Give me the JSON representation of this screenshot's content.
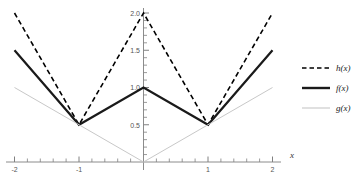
{
  "chart_data": {
    "type": "line",
    "title": "",
    "subtitle": "",
    "xlabel": "x",
    "ylabel": "",
    "xlim": [
      -2.1,
      2.12
    ],
    "ylim": [
      -0.12,
      2.08
    ],
    "grid": false,
    "legend_position": "right",
    "x_ticks": [
      -2,
      -1,
      1,
      2
    ],
    "x_tick_labels": [
      "-2",
      "-1",
      "1",
      "2"
    ],
    "y_ticks": [
      0.5,
      1.0,
      1.5,
      2.0
    ],
    "y_tick_labels": [
      "0.5",
      "1.0",
      "1.5",
      "2.0"
    ],
    "x_minor_ticks": [
      -1.8,
      -1.6,
      -1.4,
      -1.2,
      -0.8,
      -0.6,
      -0.4,
      -0.2,
      0.2,
      0.4,
      0.6,
      0.8,
      1.2,
      1.4,
      1.6,
      1.8
    ],
    "y_minor_ticks": [
      0.1,
      0.2,
      0.3,
      0.4,
      0.6,
      0.7,
      0.8,
      0.9,
      1.1,
      1.2,
      1.3,
      1.4,
      1.6,
      1.7,
      1.8,
      1.9
    ],
    "series": [
      {
        "name": "h(x)",
        "style": "dashed",
        "color": "#000000",
        "width": 1.6,
        "x": [
          -2,
          -1,
          0,
          1,
          2
        ],
        "values": [
          2.0,
          0.5,
          2.0,
          0.5,
          2.0
        ]
      },
      {
        "name": "f(x)",
        "style": "solid",
        "color": "#1a1a1a",
        "width": 2.2,
        "x": [
          -2,
          -1,
          0,
          1,
          2
        ],
        "values": [
          1.5,
          0.5,
          1.0,
          0.5,
          1.5
        ]
      },
      {
        "name": "g(x)",
        "style": "solid",
        "color": "#c8c8c8",
        "width": 1.0,
        "x": [
          -2,
          0,
          2
        ],
        "values": [
          1.0,
          0.0,
          1.0
        ]
      }
    ],
    "legend": [
      {
        "label": "h(x)",
        "style": "dashed",
        "color": "#000000",
        "width": 1.6
      },
      {
        "label": "f(x)",
        "style": "solid",
        "color": "#1a1a1a",
        "width": 2.4
      },
      {
        "label": "g(x)",
        "style": "solid",
        "color": "#cccccc",
        "width": 1.2
      }
    ],
    "axis_color": "#808080",
    "tick_color": "#808080",
    "background": "#ffffff"
  }
}
